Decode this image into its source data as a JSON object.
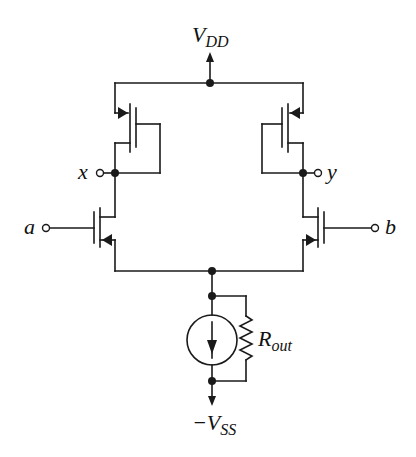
{
  "diagram": {
    "type": "differential-pair-circuit",
    "stroke_color": "#1a1a1a",
    "labels": {
      "vdd_main": "V",
      "vdd_sub": "DD",
      "vss_prefix": "−V",
      "vss_sub": "SS",
      "node_x": "x",
      "node_y": "y",
      "input_a": "a",
      "input_b": "b",
      "rout_main": "R",
      "rout_sub": "out"
    },
    "components": [
      {
        "id": "M3",
        "kind": "PMOS",
        "role": "diode-connected load",
        "side": "left"
      },
      {
        "id": "M4",
        "kind": "PMOS",
        "role": "diode-connected load",
        "side": "right"
      },
      {
        "id": "M1",
        "kind": "PMOS",
        "role": "input transistor",
        "side": "left",
        "gate": "a"
      },
      {
        "id": "M2",
        "kind": "PMOS",
        "role": "input transistor",
        "side": "right",
        "gate": "b"
      },
      {
        "id": "I_tail",
        "kind": "current-source",
        "direction": "down"
      },
      {
        "id": "R_out",
        "kind": "resistor",
        "label": "R_out"
      }
    ]
  }
}
